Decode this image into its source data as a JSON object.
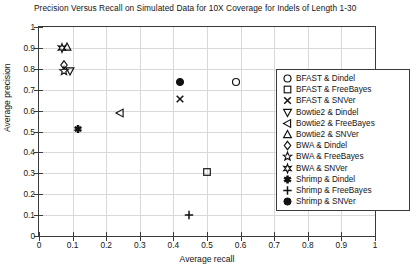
{
  "chart_data": {
    "type": "scatter",
    "title": "Precision Versus Recall on Simulated Data for 10X Coverage for Indels of Length 1-30",
    "xlabel": "Average recall",
    "ylabel": "Average precision",
    "xlim": [
      0,
      1
    ],
    "ylim": [
      0,
      1
    ],
    "xticks": [
      "0",
      "0.1",
      "0.2",
      "0.3",
      "0.4",
      "0.5",
      "0.6",
      "0.7",
      "0.8",
      "0.9",
      "1"
    ],
    "yticks": [
      "0",
      "0.1",
      "0.2",
      "0.3",
      "0.4",
      "0.5",
      "0.6",
      "0.7",
      "0.8",
      "0.9",
      "1"
    ],
    "grid": true,
    "legend_position": "right",
    "series": [
      {
        "name": "BFAST & Dindel",
        "marker": "circle-open",
        "x": 0.585,
        "y": 0.735
      },
      {
        "name": "BFAST & FreeBayes",
        "marker": "square-open",
        "x": 0.5,
        "y": 0.305
      },
      {
        "name": "BFAST & SNVer",
        "marker": "x",
        "x": 0.42,
        "y": 0.655
      },
      {
        "name": "Bowtie2 & Dindel",
        "marker": "triangle-down",
        "x": 0.093,
        "y": 0.79
      },
      {
        "name": "Bowtie2 & FreeBayes",
        "marker": "triangle-left",
        "x": 0.24,
        "y": 0.59
      },
      {
        "name": "Bowtie2 & SNVer",
        "marker": "triangle-up",
        "x": 0.082,
        "y": 0.905
      },
      {
        "name": "BWA & Dindel",
        "marker": "diamond",
        "x": 0.075,
        "y": 0.82
      },
      {
        "name": "BWA & FreeBayes",
        "marker": "star5",
        "x": 0.073,
        "y": 0.788
      },
      {
        "name": "BWA & SNVer",
        "marker": "star6",
        "x": 0.068,
        "y": 0.898
      },
      {
        "name": "Shrimp & Dindel",
        "marker": "asterisk",
        "x": 0.115,
        "y": 0.51
      },
      {
        "name": "Shrimp & FreeBayes",
        "marker": "plus",
        "x": 0.445,
        "y": 0.1
      },
      {
        "name": "Shrimp & SNVer",
        "marker": "circle-filled",
        "x": 0.42,
        "y": 0.735
      }
    ]
  }
}
